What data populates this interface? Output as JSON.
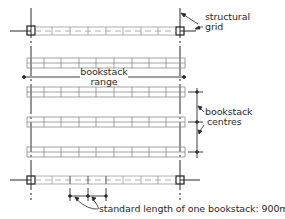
{
  "diagram": {
    "type": "plan-diagram",
    "colors": {
      "line": "#2a2a2a",
      "shelf_line": "#9a9a9a",
      "background": "#ffffff"
    },
    "labels": {
      "structural_grid_line1": "structural",
      "structural_grid_line2": "grid",
      "bookstack_range_line1": "bookstack",
      "bookstack_range_line2": "range",
      "bookstack_centres_line1": "bookstack",
      "bookstack_centres_line2": "centres",
      "standard_length": "standard length of one bookstack: 900mm"
    },
    "elements": {
      "grid_columns": 4,
      "bookstack_rows_between_columns": 4,
      "modules_per_row": 9,
      "standard_length_mm": 900
    }
  }
}
